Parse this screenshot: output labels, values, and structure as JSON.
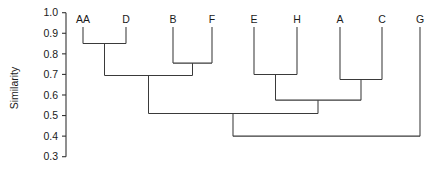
{
  "chart_data": {
    "type": "dendrogram",
    "title": "",
    "xlabel": "",
    "ylabel": "Similarity",
    "ylim": [
      0.3,
      1.0
    ],
    "y_ticks": [
      "1.0",
      "0.9",
      "0.8",
      "0.7",
      "0.6",
      "0.5",
      "0.4",
      "0.3"
    ],
    "y_tick_values": [
      1.0,
      0.9,
      0.8,
      0.7,
      0.6,
      0.5,
      0.4,
      0.3
    ],
    "grid": false,
    "legend": "none",
    "orientation": "top-down",
    "leaf_labels": [
      "AA",
      "D",
      "B",
      "F",
      "E",
      "H",
      "A",
      "C",
      "G"
    ],
    "leaves": [
      {
        "label": "AA",
        "x": 83
      },
      {
        "label": "D",
        "x": 126
      },
      {
        "label": "B",
        "x": 173
      },
      {
        "label": "F",
        "x": 212
      },
      {
        "label": "E",
        "x": 254
      },
      {
        "label": "H",
        "x": 297
      },
      {
        "label": "A",
        "x": 340
      },
      {
        "label": "C",
        "x": 382
      },
      {
        "label": "G",
        "x": 420
      }
    ],
    "leaf_top_value": 0.93,
    "merges": [
      {
        "id": "m1",
        "members": [
          "AA",
          "D"
        ],
        "similarity": 0.85,
        "x": 104.5
      },
      {
        "id": "m2",
        "members": [
          "B",
          "F"
        ],
        "similarity": 0.755,
        "x": 192.5
      },
      {
        "id": "m3",
        "members": [
          "AA",
          "D",
          "B",
          "F"
        ],
        "similarity": 0.695,
        "x": 148.5
      },
      {
        "id": "m4",
        "members": [
          "E",
          "H"
        ],
        "similarity": 0.7,
        "x": 275.5
      },
      {
        "id": "m5",
        "members": [
          "A",
          "C"
        ],
        "similarity": 0.675,
        "x": 361.0
      },
      {
        "id": "m6",
        "members": [
          "E",
          "H",
          "A",
          "C"
        ],
        "similarity": 0.575,
        "x": 318.0
      },
      {
        "id": "m7",
        "members": [
          "AA",
          "D",
          "B",
          "F",
          "E",
          "H",
          "A",
          "C"
        ],
        "similarity": 0.51,
        "x": 233.0
      },
      {
        "id": "m8",
        "members": [
          "AA",
          "D",
          "B",
          "F",
          "E",
          "H",
          "A",
          "C",
          "G"
        ],
        "similarity": 0.4,
        "x": 327.0
      }
    ],
    "colors": {
      "line": "#3a3a3a",
      "axis": "#333333",
      "text": "#1a1a1a",
      "background": "#ffffff"
    }
  }
}
